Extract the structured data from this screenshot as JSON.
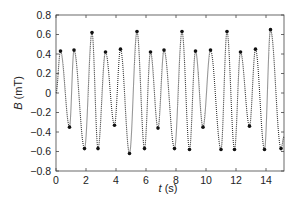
{
  "chart_data": {
    "type": "line",
    "title": "",
    "xlabel": "t (s)",
    "xlabel_var": "t",
    "xlabel_unit": " (s)",
    "ylabel": "B (mT)",
    "ylabel_var": "B",
    "ylabel_unit": " (mT)",
    "xlim": [
      0,
      15.2
    ],
    "ylim": [
      -0.8,
      0.8
    ],
    "xticks": [
      0,
      2,
      4,
      6,
      8,
      10,
      12,
      14
    ],
    "yticks": [
      0.8,
      0.6,
      0.4,
      0.2,
      0,
      -0.2,
      -0.4,
      -0.6,
      -0.8
    ],
    "ytick_labels": [
      "0.8",
      "0.6",
      "0.4",
      "0.2",
      "0",
      "−0.2",
      "−0.4",
      "−0.6",
      "−0.8"
    ],
    "grid": false,
    "legend": null,
    "marker": "dotted (+) markers",
    "series": [
      {
        "name": "B(t)",
        "color": "#333333",
        "extrema": [
          {
            "t": 0.0,
            "B": 0.0
          },
          {
            "t": 0.3,
            "B": 0.43
          },
          {
            "t": 0.9,
            "B": -0.35
          },
          {
            "t": 1.2,
            "B": 0.44
          },
          {
            "t": 1.9,
            "B": -0.57
          },
          {
            "t": 2.4,
            "B": 0.62
          },
          {
            "t": 2.8,
            "B": -0.57
          },
          {
            "t": 3.3,
            "B": 0.42
          },
          {
            "t": 3.9,
            "B": -0.33
          },
          {
            "t": 4.3,
            "B": 0.45
          },
          {
            "t": 4.9,
            "B": -0.62
          },
          {
            "t": 5.4,
            "B": 0.63
          },
          {
            "t": 5.9,
            "B": -0.57
          },
          {
            "t": 6.3,
            "B": 0.42
          },
          {
            "t": 6.8,
            "B": -0.36
          },
          {
            "t": 7.2,
            "B": 0.44
          },
          {
            "t": 7.9,
            "B": -0.57
          },
          {
            "t": 8.4,
            "B": 0.63
          },
          {
            "t": 8.9,
            "B": -0.58
          },
          {
            "t": 9.3,
            "B": 0.43
          },
          {
            "t": 9.8,
            "B": -0.35
          },
          {
            "t": 10.3,
            "B": 0.44
          },
          {
            "t": 11.0,
            "B": -0.58
          },
          {
            "t": 11.4,
            "B": 0.63
          },
          {
            "t": 11.9,
            "B": -0.58
          },
          {
            "t": 12.3,
            "B": 0.42
          },
          {
            "t": 12.9,
            "B": -0.34
          },
          {
            "t": 13.3,
            "B": 0.45
          },
          {
            "t": 13.9,
            "B": -0.58
          },
          {
            "t": 14.3,
            "B": 0.65
          },
          {
            "t": 15.0,
            "B": -0.57
          },
          {
            "t": 15.2,
            "B": -0.45
          }
        ]
      }
    ]
  }
}
